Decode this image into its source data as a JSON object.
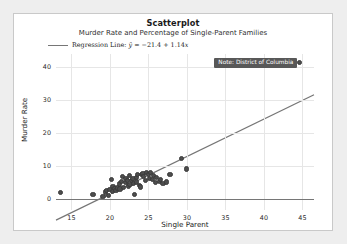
{
  "figure": {
    "title": "Scatterplot",
    "subtitle": "Murder Rate and Percentage of Single-Parent Families",
    "legend_label": "Regression Line:",
    "legend_equation_y": "ŷ",
    "legend_equation_rest": " = −21.4 + 1.14",
    "legend_equation_x": "x",
    "annotation": "Note: District of Columbia",
    "colors": {
      "point": "#4d4d4d",
      "regression_line": "#767676",
      "grid": "#e6e6e6",
      "annotation_bg": "#585858",
      "canvas": "#ffffff",
      "page_bg": "#eeeeee"
    }
  },
  "chart_data": {
    "type": "scatter",
    "title": "Scatterplot",
    "subtitle": "Murder Rate and Percentage of Single-Parent Families",
    "xlabel": "Single Parent",
    "ylabel": "Murder Rate",
    "xlim": [
      13.0,
      46.5
    ],
    "ylim": [
      -3.5,
      44.0
    ],
    "xticks": [
      15,
      20,
      25,
      30,
      35,
      40,
      45
    ],
    "yticks": [
      0,
      10,
      20,
      30,
      40
    ],
    "grid": true,
    "legend_position": "upper-left-outside",
    "series": [
      {
        "name": "States",
        "x": [
          13.6,
          17.8,
          19.1,
          19.4,
          19.6,
          19.8,
          20.0,
          20.2,
          20.3,
          20.4,
          20.6,
          20.8,
          21.0,
          21.2,
          21.3,
          21.5,
          21.6,
          21.8,
          22.0,
          22.1,
          22.3,
          22.4,
          22.5,
          22.6,
          22.8,
          23.0,
          23.1,
          23.2,
          23.4,
          23.5,
          23.6,
          23.8,
          24.0,
          24.1,
          24.3,
          24.4,
          24.6,
          24.8,
          25.0,
          25.1,
          25.3,
          25.5,
          25.7,
          25.9,
          26.1,
          26.4,
          26.6,
          26.9,
          27.3,
          27.8,
          29.3,
          29.9
        ],
        "y": [
          1.8,
          1.2,
          0.5,
          2.0,
          2.5,
          1.0,
          2.8,
          5.8,
          2.2,
          3.6,
          3.0,
          2.4,
          3.2,
          4.4,
          2.9,
          5.2,
          6.6,
          3.4,
          4.8,
          6.2,
          5.4,
          3.8,
          7.0,
          4.2,
          5.6,
          6.0,
          4.6,
          1.2,
          6.4,
          5.0,
          7.2,
          4.0,
          3.5,
          7.4,
          7.6,
          6.8,
          5.5,
          7.8,
          7.3,
          6.1,
          8.0,
          5.8,
          7.1,
          4.9,
          6.5,
          5.2,
          5.7,
          4.5,
          5.0,
          7.2,
          12.3,
          9.0
        ]
      },
      {
        "name": "District of Columbia",
        "x": [
          44.6
        ],
        "y": [
          41.3
        ]
      }
    ],
    "regression": {
      "label": "Regression Line",
      "equation": "ŷ = −21.4 + 1.14x",
      "intercept": -21.4,
      "slope": 1.14
    },
    "annotations": [
      {
        "text": "Note: District of Columbia",
        "x": 44.6,
        "y": 41.3
      }
    ]
  }
}
